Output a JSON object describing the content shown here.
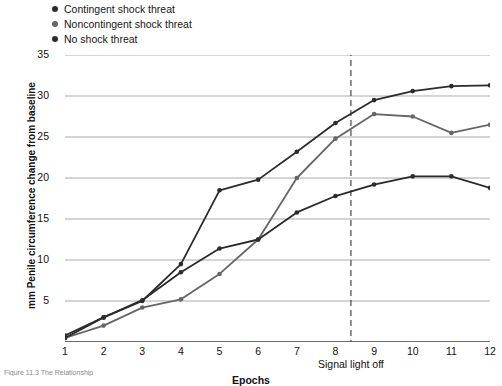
{
  "legend": {
    "items": [
      {
        "label": "Contingent shock threat",
        "color": "#2b2b2b"
      },
      {
        "label": "Noncontingent shock threat",
        "color": "#666666"
      },
      {
        "label": "No shock threat",
        "color": "#2b2b2b"
      }
    ]
  },
  "annotations": {
    "signal_light_off": "Signal light off",
    "signal_light_off_epoch": 8.4
  },
  "caption": "Figure 11.3  The Relationship",
  "chart_data": {
    "type": "line",
    "title": "",
    "xlabel": "Epochs",
    "ylabel": "mm Penile circumference change from baseline",
    "x": [
      1,
      2,
      3,
      4,
      5,
      6,
      7,
      8,
      9,
      10,
      11,
      12
    ],
    "xticklabels": [
      "1",
      "2",
      "3",
      "4",
      "5",
      "6",
      "7",
      "8",
      "9",
      "10",
      "11",
      "12"
    ],
    "yticklabels": [
      "5",
      "10",
      "15",
      "20",
      "25",
      "30",
      "35"
    ],
    "yticks": [
      5,
      10,
      15,
      20,
      25,
      30,
      35
    ],
    "xlim": [
      1,
      12
    ],
    "ylim": [
      0,
      35
    ],
    "grid": "horizontal",
    "legend_position": "top-left",
    "series": [
      {
        "name": "Contingent shock threat",
        "color": "#2b2b2b",
        "values": [
          0.8,
          3.0,
          5.0,
          9.5,
          18.5,
          19.8,
          23.2,
          26.7,
          29.5,
          30.6,
          31.2,
          31.3
        ]
      },
      {
        "name": "Noncontingent shock threat",
        "color": "#666666",
        "values": [
          0.5,
          2.0,
          4.2,
          5.2,
          8.3,
          12.5,
          20.0,
          24.8,
          27.8,
          27.5,
          25.5,
          26.5
        ]
      },
      {
        "name": "No shock threat",
        "color": "#2b2b2b",
        "values": [
          0.5,
          3.0,
          5.1,
          8.5,
          11.4,
          12.5,
          15.8,
          17.8,
          19.2,
          20.2,
          20.2,
          18.8
        ]
      }
    ],
    "vline": {
      "x": 8.4,
      "label": "Signal light off",
      "style": "dashed",
      "color": "#555555"
    }
  }
}
